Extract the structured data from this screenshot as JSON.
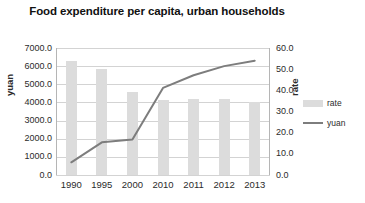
{
  "chart_data": {
    "type": "bar",
    "title": "Food expenditure per capita, urban households",
    "categories": [
      "1990",
      "1995",
      "2000",
      "2010",
      "2011",
      "2012",
      "2013"
    ],
    "xlabel": "",
    "ylabel": "yuan",
    "ylabel_secondary": "rate",
    "ylim": [
      0,
      7000
    ],
    "ylim_secondary": [
      0,
      60
    ],
    "grid": true,
    "legend_position": "right",
    "series": [
      {
        "name": "rate",
        "type": "bar",
        "axis": "secondary",
        "color": "#dcdcdc",
        "values": [
          54.0,
          50.0,
          39.0,
          35.5,
          36.0,
          36.0,
          34.5
        ]
      },
      {
        "name": "yuan",
        "type": "line",
        "axis": "primary",
        "color": "#7d7d7d",
        "values": [
          700,
          1800,
          1960,
          4800,
          5500,
          6000,
          6300
        ]
      }
    ],
    "yticks": [
      "0.0",
      "1000.0",
      "2000.0",
      "3000.0",
      "4000.0",
      "5000.0",
      "6000.0",
      "7000.0"
    ],
    "ytick_values": [
      0,
      1000,
      2000,
      3000,
      4000,
      5000,
      6000,
      7000
    ],
    "yticks_secondary": [
      "0.0",
      "10.0",
      "20.0",
      "30.0",
      "40.0",
      "50.0",
      "60.0"
    ],
    "ytick_values_secondary": [
      0,
      10,
      20,
      30,
      40,
      50,
      60
    ]
  },
  "legend": {
    "items": [
      {
        "label": "rate",
        "marker": "bar-swatch"
      },
      {
        "label": "yuan",
        "marker": "line-swatch"
      }
    ]
  }
}
